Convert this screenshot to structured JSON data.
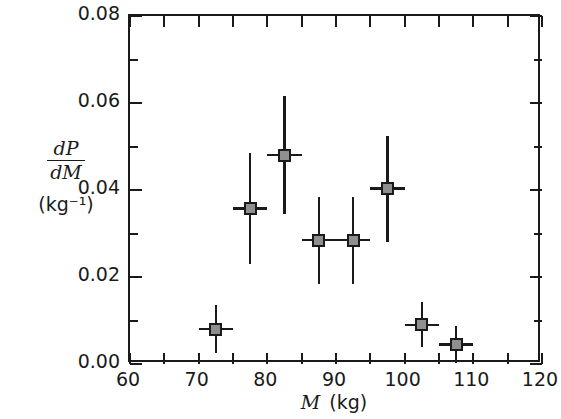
{
  "chart_data": {
    "type": "scatter",
    "title": "",
    "xlabel": "M  (kg)",
    "xlabel_var": "M",
    "xlabel_unit": "(kg)",
    "ylabel_numerator": "dP",
    "ylabel_denominator": "dM",
    "ylabel_units": "(kg⁻¹)",
    "xlim": [
      60,
      120
    ],
    "ylim": [
      0.0,
      0.08
    ],
    "grid": false,
    "legend": "none",
    "x_major_ticks": [
      60,
      70,
      80,
      90,
      100,
      110,
      120
    ],
    "x_minor_ticks": [
      65,
      75,
      85,
      95,
      105,
      115
    ],
    "x_tick_labels": [
      "60",
      "70",
      "80",
      "90",
      "100",
      "110",
      "120"
    ],
    "y_major_ticks": [
      0.0,
      0.02,
      0.04,
      0.06,
      0.08
    ],
    "y_minor_ticks": [
      0.01,
      0.03,
      0.05,
      0.07
    ],
    "y_tick_labels": [
      "0.00",
      "0.02",
      "0.04",
      "0.06",
      "0.08"
    ],
    "marker_fill": "#8f8f8f",
    "marker_edge": "#1a1a1a",
    "points": [
      {
        "x": 72.5,
        "y": 0.008,
        "xerr": 2.5,
        "yerr": 0.0055
      },
      {
        "x": 77.5,
        "y": 0.0358,
        "xerr": 2.5,
        "yerr": 0.0128
      },
      {
        "x": 82.5,
        "y": 0.048,
        "xerr": 2.5,
        "yerr": 0.0135
      },
      {
        "x": 87.5,
        "y": 0.0285,
        "xerr": 2.5,
        "yerr": 0.01
      },
      {
        "x": 92.5,
        "y": 0.0285,
        "xerr": 2.5,
        "yerr": 0.01
      },
      {
        "x": 97.5,
        "y": 0.0403,
        "xerr": 2.5,
        "yerr": 0.0122
      },
      {
        "x": 102.5,
        "y": 0.009,
        "xerr": 2.5,
        "yerr": 0.0052
      },
      {
        "x": 107.5,
        "y": 0.0045,
        "xerr": 2.5,
        "yerr": 0.0042
      }
    ]
  }
}
